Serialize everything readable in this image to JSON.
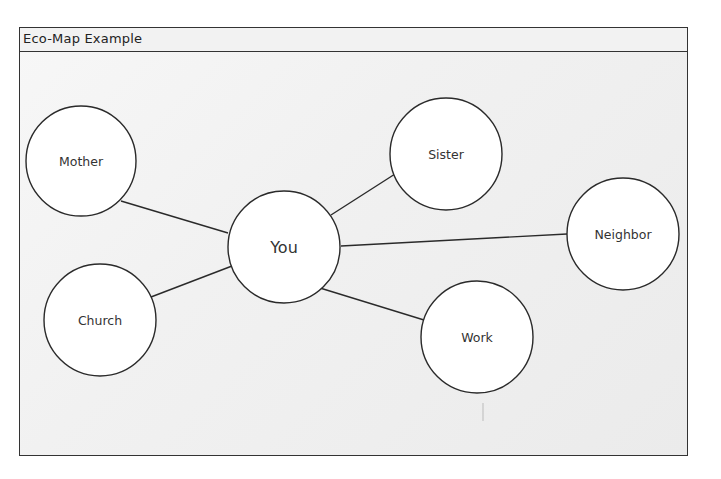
{
  "title": "Eco-Map Example",
  "diagram": {
    "center": {
      "id": "you",
      "label": "You",
      "cx": 284,
      "cy": 247,
      "r": 56
    },
    "nodes": [
      {
        "id": "mother",
        "label": "Mother",
        "cx": 81,
        "cy": 161,
        "r": 55
      },
      {
        "id": "sister",
        "label": "Sister",
        "cx": 446,
        "cy": 154,
        "r": 56
      },
      {
        "id": "neighbor",
        "label": "Neighbor",
        "cx": 623,
        "cy": 234,
        "r": 56
      },
      {
        "id": "church",
        "label": "Church",
        "cx": 100,
        "cy": 320,
        "r": 56
      },
      {
        "id": "work",
        "label": "Work",
        "cx": 477,
        "cy": 337,
        "r": 56
      }
    ],
    "edges": [
      {
        "from": "you",
        "to": "mother",
        "x1": 228,
        "y1": 233,
        "x2": 121,
        "y2": 201
      },
      {
        "from": "you",
        "to": "sister",
        "x1": 331,
        "y1": 215,
        "x2": 395,
        "y2": 174
      },
      {
        "from": "you",
        "to": "neighbor",
        "x1": 341,
        "y1": 246,
        "x2": 567,
        "y2": 234
      },
      {
        "from": "you",
        "to": "church",
        "x1": 232,
        "y1": 266,
        "x2": 151,
        "y2": 297
      },
      {
        "from": "you",
        "to": "work",
        "x1": 320,
        "y1": 288,
        "x2": 424,
        "y2": 320
      }
    ],
    "stroke_color": "#2a2a2a",
    "node_fill": "#ffffff"
  }
}
